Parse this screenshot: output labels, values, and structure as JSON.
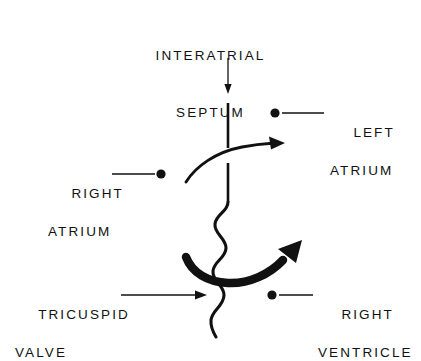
{
  "figure": {
    "background_color": "#ffffff",
    "ink_color": "#111111"
  },
  "labels": {
    "interatrial_septum": {
      "line1": "INTERATRIAL",
      "line2": "SEPTUM"
    },
    "left_atrium": {
      "line1": "LEFT",
      "line2": "ATRIUM"
    },
    "right_atrium": {
      "line1": "RIGHT",
      "line2": "ATRIUM"
    },
    "right_ventricle": {
      "line1": "RIGHT",
      "line2": "VENTRICLE"
    },
    "tricuspid_valve": {
      "line1": "TRICUSPID",
      "line2": "VALVE"
    }
  },
  "annotations": {
    "septum_pointer": "arrow pointing down to interatrial septum",
    "left_atrium_leader": "leader line with dot marking left atrium",
    "right_atrium_leader": "leader line with dot marking right atrium",
    "right_ventricle_leader": "leader line with dot marking right ventricle",
    "tricuspid_valve_pointer": "arrow pointing right to tricuspid valve",
    "upper_flow_arrow": "thin curved arrow: right atrium to left atrium shunt",
    "lower_flow_arrow": "thick curved arrow: flow across tricuspid valve"
  }
}
